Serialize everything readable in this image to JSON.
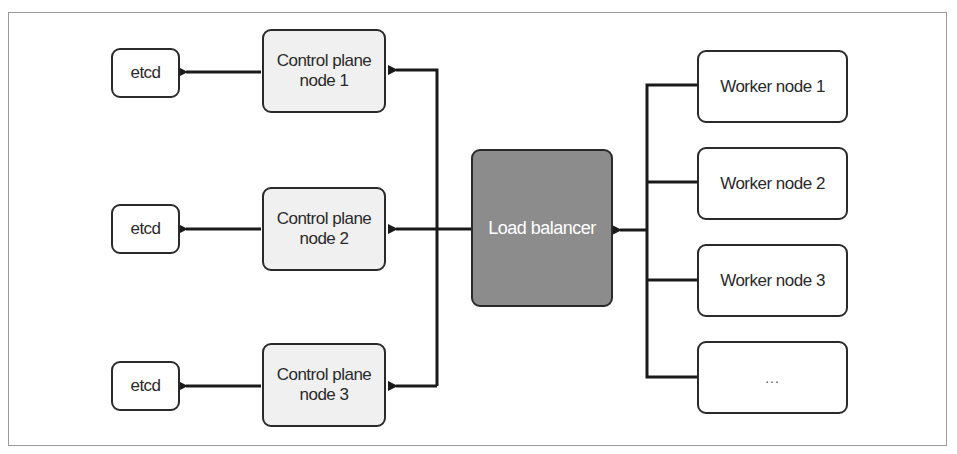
{
  "diagram": {
    "title": "",
    "etcd_nodes": [
      {
        "label": "etcd"
      },
      {
        "label": "etcd"
      },
      {
        "label": "etcd"
      }
    ],
    "control_plane_nodes": [
      {
        "label": "Control plane node 1",
        "line1": "Control plane",
        "line2": "node 1"
      },
      {
        "label": "Control plane node 2",
        "line1": "Control plane",
        "line2": "node 2"
      },
      {
        "label": "Control plane node 3",
        "line1": "Control plane",
        "line2": "node 3"
      }
    ],
    "load_balancer": {
      "label": "Load balancer"
    },
    "worker_nodes": [
      {
        "label": "Worker node 1"
      },
      {
        "label": "Worker node 2"
      },
      {
        "label": "Worker node 3"
      },
      {
        "label": "..."
      }
    ],
    "edges": [
      {
        "from": "Worker nodes",
        "to": "Load balancer"
      },
      {
        "from": "Load balancer",
        "to": "Control plane node 1"
      },
      {
        "from": "Load balancer",
        "to": "Control plane node 2"
      },
      {
        "from": "Load balancer",
        "to": "Control plane node 3"
      },
      {
        "from": "Control plane node 1",
        "to": "etcd"
      },
      {
        "from": "Control plane node 2",
        "to": "etcd"
      },
      {
        "from": "Control plane node 3",
        "to": "etcd"
      }
    ],
    "colors": {
      "stroke": "#2a2a2a",
      "control_plane_fill": "#f0f0f0",
      "load_balancer_fill": "#8c8c8c",
      "box_fill": "#ffffff"
    }
  }
}
